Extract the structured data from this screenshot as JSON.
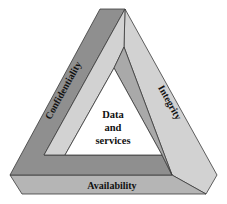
{
  "diagram": {
    "type": "penrose-triangle",
    "center": {
      "lines": [
        "Data",
        "and",
        "services"
      ]
    },
    "sides": {
      "left": {
        "label": "Confidentiality"
      },
      "right": {
        "label": "Integrity"
      },
      "bottom": {
        "label": "Availability"
      }
    },
    "colors": {
      "background": "#ffffff",
      "dark_face": "#8f8f8f",
      "mid_face": "#a9a9a9",
      "light_face": "#d2d2d2",
      "bottom_face": "#b5b5b5",
      "inner_white": "#ffffff",
      "outline": "#3a3a3a",
      "text": "#111111"
    }
  }
}
